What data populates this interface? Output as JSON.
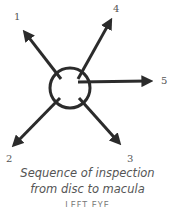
{
  "diagram": {
    "center": {
      "x": 70,
      "y": 88,
      "r": 20
    },
    "color": "#2b2b2b",
    "arrows": [
      {
        "label": "1",
        "from": [
          61,
          79
        ],
        "to": [
          23,
          30
        ],
        "label_pos": [
          14,
          20
        ]
      },
      {
        "label": "2",
        "from": [
          60,
          98
        ],
        "to": [
          12,
          147
        ],
        "label_pos": [
          6,
          162
        ]
      },
      {
        "label": "3",
        "from": [
          79,
          98
        ],
        "to": [
          121,
          145
        ],
        "label_pos": [
          127,
          162
        ]
      },
      {
        "label": "4",
        "from": [
          78,
          79
        ],
        "to": [
          112,
          18
        ],
        "label_pos": [
          113,
          12
        ]
      },
      {
        "label": "5",
        "from": [
          78,
          82
        ],
        "to": [
          153,
          81
        ],
        "label_pos": [
          161,
          84
        ]
      }
    ]
  },
  "caption": {
    "line1": "Sequence of inspection",
    "line2": "from disc to macula"
  },
  "cut_text": "LEFT EYE"
}
